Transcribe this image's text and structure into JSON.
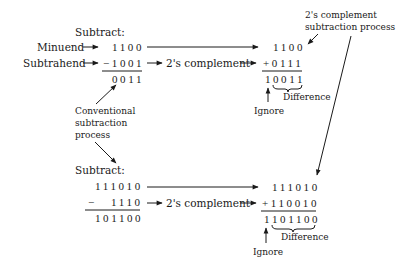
{
  "top": {
    "subtract_label": "Subtract:",
    "minuend_label": "Minuend",
    "subtrahend_label": "Subtrahend",
    "minuend": "1100",
    "subtrahend": "−1001",
    "result": "0011",
    "complement_label": "2's complement",
    "tc_minuend": "1100",
    "tc_addend": "+0111",
    "tc_carry": "1",
    "tc_result": "0011",
    "ignore_label": "Ignore",
    "difference_label": "Difference"
  },
  "bottom": {
    "subtract_label": "Subtract:",
    "minuend": "111010",
    "minus_sign": "−",
    "subtrahend": "1110",
    "result": "101100",
    "complement_label": "2's complement",
    "tc_minuend": "111010",
    "tc_addend": "+110010",
    "tc_carry": "1",
    "tc_result": "101100",
    "ignore_label": "Ignore",
    "difference_label": "Difference"
  },
  "annotations": {
    "conventional_line1": "Conventional",
    "conventional_line2": "subtraction",
    "conventional_line3": "process",
    "twos_line1": "2's complement",
    "twos_line2": "subtraction process"
  }
}
